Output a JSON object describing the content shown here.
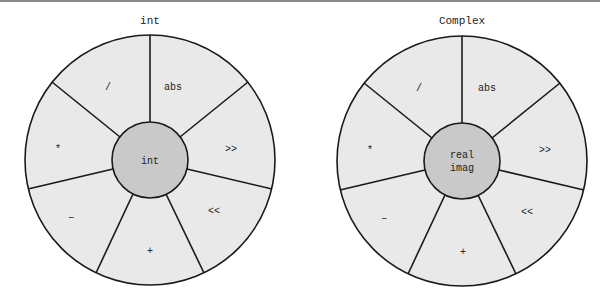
{
  "wheels": [
    {
      "title": "int",
      "center_label": [
        "int"
      ],
      "segments": [
        "abs",
        ">>",
        "<<",
        "+",
        "−",
        "*",
        "/"
      ]
    },
    {
      "title": "Complex",
      "center_label": [
        "real",
        "imag"
      ],
      "segments": [
        "abs",
        ">>",
        "<<",
        "+",
        "−",
        "*",
        "/"
      ]
    }
  ],
  "colors": {
    "segment_fill": "#e9e9e9",
    "hub_fill": "#c9c9c9",
    "stroke": "#1a1a1a"
  }
}
